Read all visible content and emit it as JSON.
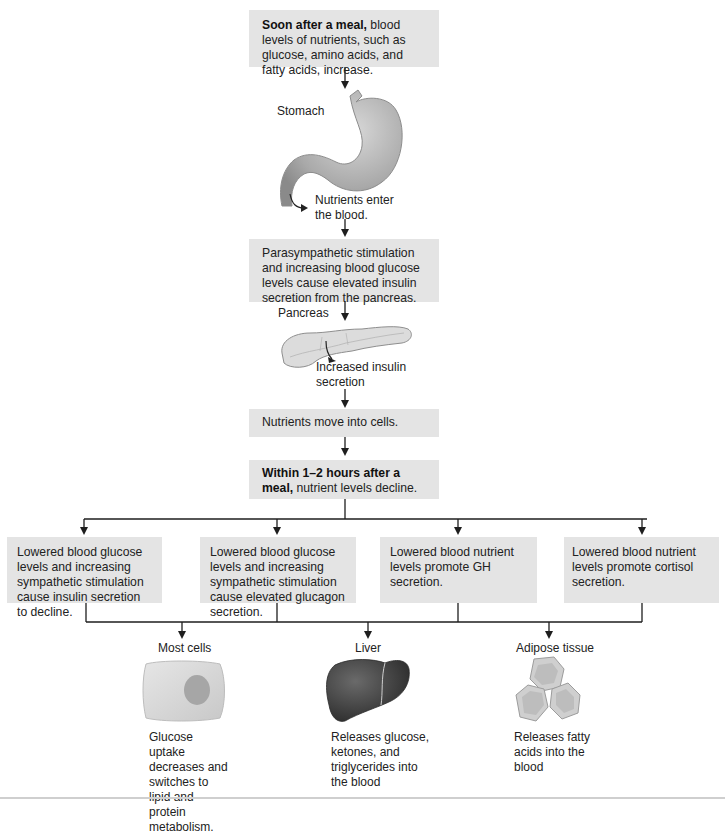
{
  "flow": {
    "step1": {
      "bold": "Soon after a meal,",
      "text": " blood levels of nutrients, such as glucose, amino acids, and fatty acids, increase."
    },
    "stomach": {
      "label": "Stomach",
      "annotation": "Nutrients enter the blood."
    },
    "step2": {
      "text": "Parasympathetic stimulation and increasing blood glucose levels cause elevated insulin secretion from the pancreas."
    },
    "pancreas": {
      "label": "Pancreas",
      "annotation": "Increased insulin secretion"
    },
    "step3": {
      "text": "Nutrients move into cells."
    },
    "step4": {
      "bold": "Within 1–2 hours after a meal,",
      "text": " nutrient levels decline."
    }
  },
  "responses": [
    {
      "text": "Lowered blood glucose levels and increasing sympathetic stimulation cause insulin secretion to decline."
    },
    {
      "text": "Lowered blood glucose levels and increasing sympathetic stimulation cause elevated glucagon secretion."
    },
    {
      "text": "Lowered blood nutrient levels promote GH secretion."
    },
    {
      "text": "Lowered blood nutrient levels promote cortisol secretion."
    }
  ],
  "targets": [
    {
      "label": "Most cells",
      "description": "Glucose uptake decreases and switches to lipid and protein metabolism."
    },
    {
      "label": "Liver",
      "description": "Releases glucose, ketones, and triglycerides into the blood"
    },
    {
      "label": "Adipose tissue",
      "description": "Releases fatty acids into the blood"
    }
  ],
  "colors": {
    "box_fill": "#e4e4e4",
    "line": "#1e1e1e",
    "liver": "#4a4a4a",
    "organ_gray": "#a8a8a8"
  }
}
